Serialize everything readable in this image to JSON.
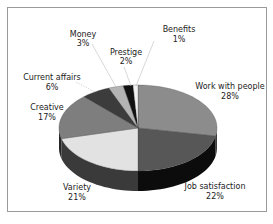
{
  "chart_data": {
    "type": "pie",
    "style": "3d",
    "title": "",
    "start_angle_deg": 0,
    "direction": "clockwise",
    "slices": [
      {
        "label": "Work with people",
        "value": 28,
        "pct_label": "28%",
        "color": "#8c8c8c",
        "side_color": "#3c3c3c"
      },
      {
        "label": "Job satisfaction",
        "value": 22,
        "pct_label": "22%",
        "color": "#575757",
        "side_color": "#0c0c0c"
      },
      {
        "label": "Variety",
        "value": 21,
        "pct_label": "21%",
        "color": "#e2e2e2",
        "side_color": "#3a3a3a"
      },
      {
        "label": "Creative",
        "value": 17,
        "pct_label": "17%",
        "color": "#7e7e7e",
        "side_color": "#262626"
      },
      {
        "label": "Current affairs",
        "value": 6,
        "pct_label": "6%",
        "color": "#3c3c3c",
        "side_color": "#1a1a1a"
      },
      {
        "label": "Money",
        "value": 3,
        "pct_label": "3%",
        "color": "#b4b4b4",
        "side_color": "#555555"
      },
      {
        "label": "Prestige",
        "value": 2,
        "pct_label": "2%",
        "color": "#121212",
        "side_color": "#000000"
      },
      {
        "label": "Benefits",
        "value": 1,
        "pct_label": "1%",
        "color": "#f2f2f2",
        "side_color": "#777777"
      }
    ],
    "legend": "none (callout labels)"
  },
  "labels": {
    "work_with_people": {
      "name": "Work with people",
      "pct": "28%"
    },
    "job_satisfaction": {
      "name": "Job satisfaction",
      "pct": "22%"
    },
    "variety": {
      "name": "Variety",
      "pct": "21%"
    },
    "creative": {
      "name": "Creative",
      "pct": "17%"
    },
    "current_affairs": {
      "name": "Current affairs",
      "pct": "6%"
    },
    "money": {
      "name": "Money",
      "pct": "3%"
    },
    "prestige": {
      "name": "Prestige",
      "pct": "2%"
    },
    "benefits": {
      "name": "Benefits",
      "pct": "1%"
    }
  }
}
